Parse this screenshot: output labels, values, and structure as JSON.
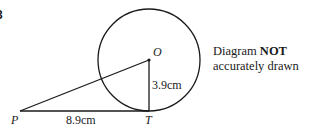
{
  "question_number": "3",
  "points": {
    "P": {
      "label": "P",
      "x": 20,
      "y": 111
    },
    "T": {
      "label": "T",
      "x": 149,
      "y": 111
    },
    "O": {
      "label": "O",
      "x": 149,
      "y": 60
    }
  },
  "circle": {
    "cx": 149,
    "cy": 60,
    "r": 51,
    "stroke": "#1a1a1a"
  },
  "measurements": {
    "PT": "8.9cm",
    "OT": "3.9cm"
  },
  "note": {
    "line1_prefix": "Diagram ",
    "line1_bold": "NOT",
    "line2": "accurately drawn"
  }
}
